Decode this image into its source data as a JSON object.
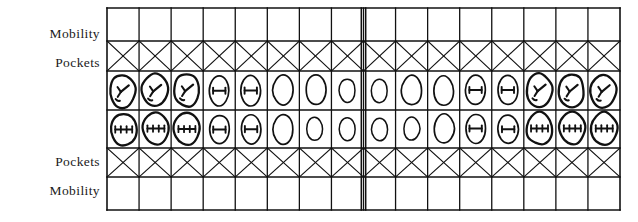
{
  "document": {
    "type": "periodontal-dental-chart",
    "description": "Periodontal charting grid with upper and lower dental arches"
  },
  "labels": {
    "mobility_top": "Mobility",
    "pockets_top": "Pockets",
    "pockets_bottom": "Pockets",
    "mobility_bottom": "Mobility"
  },
  "grid": {
    "columns": 16,
    "rows": 6,
    "row_names": [
      "mobility-upper",
      "pockets-upper",
      "teeth-upper",
      "teeth-lower",
      "pockets-lower",
      "mobility-lower"
    ],
    "left": 107,
    "right": 620,
    "row_boundaries": [
      8,
      41,
      71,
      110,
      148,
      177,
      210
    ],
    "midline_x": 363,
    "line_color": "#111111"
  },
  "chart_data": {
    "type": "table",
    "columns": 16,
    "rows": [
      {
        "name": "mobility-upper",
        "kind": "blank-cells",
        "values": [
          "",
          "",
          "",
          "",
          "",
          "",
          "",
          "",
          "",
          "",
          "",
          "",
          "",
          "",
          "",
          ""
        ]
      },
      {
        "name": "pockets-upper",
        "kind": "crossed-cells",
        "values": [
          "X",
          "X",
          "X",
          "X",
          "X",
          "X",
          "X",
          "X",
          "X",
          "X",
          "X",
          "X",
          "X",
          "X",
          "X",
          "X"
        ]
      },
      {
        "name": "teeth-upper",
        "kind": "tooth-symbols",
        "values": [
          {
            "shape": "molar",
            "mark": "y-fissure",
            "size": "large"
          },
          {
            "shape": "molar",
            "mark": "y-fissure",
            "size": "large"
          },
          {
            "shape": "molar",
            "mark": "y-fissure",
            "size": "large"
          },
          {
            "shape": "premolar",
            "mark": "bar",
            "size": "medium"
          },
          {
            "shape": "premolar",
            "mark": "bar",
            "size": "medium"
          },
          {
            "shape": "canine",
            "mark": "none",
            "size": "medium"
          },
          {
            "shape": "incisor",
            "mark": "none",
            "size": "medium"
          },
          {
            "shape": "incisor",
            "mark": "none",
            "size": "small"
          },
          {
            "shape": "incisor",
            "mark": "none",
            "size": "small"
          },
          {
            "shape": "incisor",
            "mark": "none",
            "size": "medium"
          },
          {
            "shape": "canine",
            "mark": "none",
            "size": "medium"
          },
          {
            "shape": "premolar",
            "mark": "bar",
            "size": "medium"
          },
          {
            "shape": "premolar",
            "mark": "bar",
            "size": "medium"
          },
          {
            "shape": "molar",
            "mark": "y-fissure",
            "size": "large"
          },
          {
            "shape": "molar",
            "mark": "y-fissure",
            "size": "large"
          },
          {
            "shape": "molar",
            "mark": "y-fissure",
            "size": "large"
          }
        ]
      },
      {
        "name": "teeth-lower",
        "kind": "tooth-symbols",
        "values": [
          {
            "shape": "molar",
            "mark": "ticked-bar",
            "size": "large"
          },
          {
            "shape": "molar",
            "mark": "ticked-bar",
            "size": "large"
          },
          {
            "shape": "molar",
            "mark": "ticked-bar",
            "size": "large"
          },
          {
            "shape": "premolar",
            "mark": "bar",
            "size": "medium"
          },
          {
            "shape": "premolar",
            "mark": "bar",
            "size": "medium"
          },
          {
            "shape": "canine",
            "mark": "none",
            "size": "medium"
          },
          {
            "shape": "incisor",
            "mark": "none",
            "size": "small"
          },
          {
            "shape": "incisor",
            "mark": "none",
            "size": "small"
          },
          {
            "shape": "incisor",
            "mark": "none",
            "size": "small"
          },
          {
            "shape": "incisor",
            "mark": "none",
            "size": "small"
          },
          {
            "shape": "canine",
            "mark": "none",
            "size": "medium"
          },
          {
            "shape": "premolar",
            "mark": "bar",
            "size": "medium"
          },
          {
            "shape": "premolar",
            "mark": "bar",
            "size": "medium"
          },
          {
            "shape": "molar",
            "mark": "ticked-bar",
            "size": "large"
          },
          {
            "shape": "molar",
            "mark": "ticked-bar",
            "size": "large"
          },
          {
            "shape": "molar",
            "mark": "ticked-bar",
            "size": "large"
          }
        ]
      },
      {
        "name": "pockets-lower",
        "kind": "crossed-cells",
        "values": [
          "X",
          "X",
          "X",
          "X",
          "X",
          "X",
          "X",
          "X",
          "X",
          "X",
          "X",
          "X",
          "X",
          "X",
          "X",
          "X"
        ]
      },
      {
        "name": "mobility-lower",
        "kind": "blank-cells",
        "values": [
          "",
          "",
          "",
          "",
          "",
          "",
          "",
          "",
          "",
          "",
          "",
          "",
          "",
          "",
          "",
          ""
        ]
      }
    ],
    "legend": [],
    "xlabel": "",
    "ylabel": ""
  }
}
